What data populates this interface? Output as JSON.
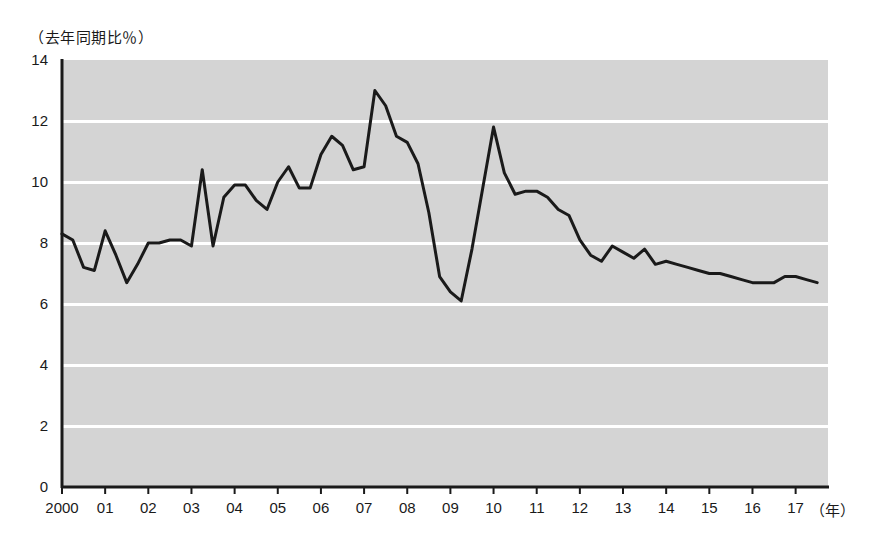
{
  "chart_data": {
    "type": "line",
    "title": "",
    "subtitle": "",
    "ylabel": "（去年同期比％）",
    "xlabel": "（年）",
    "ylim": [
      0,
      14
    ],
    "yticks": [
      0,
      2,
      4,
      6,
      8,
      10,
      12,
      14
    ],
    "ytick_labels": [
      "0",
      "2",
      "4",
      "6",
      "8",
      "10",
      "12",
      "14"
    ],
    "xlim": [
      2000,
      2017.75
    ],
    "xticks": [
      2000,
      2001,
      2002,
      2003,
      2004,
      2005,
      2006,
      2007,
      2008,
      2009,
      2010,
      2011,
      2012,
      2013,
      2014,
      2015,
      2016,
      2017
    ],
    "xtick_labels": [
      "2000",
      "01",
      "02",
      "03",
      "04",
      "05",
      "06",
      "07",
      "08",
      "09",
      "10",
      "11",
      "12",
      "13",
      "14",
      "15",
      "16",
      "17"
    ],
    "grid": true,
    "grid_color": "#ffffff",
    "plot_background": "#d4d4d4",
    "line_color": "#1a1a1a",
    "line_width": 3,
    "legend": [],
    "annotations": [],
    "series": [
      {
        "name": "前年同期比",
        "x": [
          2000.0,
          2000.25,
          2000.5,
          2000.75,
          2001.0,
          2001.25,
          2001.5,
          2001.75,
          2002.0,
          2002.25,
          2002.5,
          2002.75,
          2003.0,
          2003.25,
          2003.5,
          2003.75,
          2004.0,
          2004.25,
          2004.5,
          2004.75,
          2005.0,
          2005.25,
          2005.5,
          2005.75,
          2006.0,
          2006.25,
          2006.5,
          2006.75,
          2007.0,
          2007.25,
          2007.5,
          2007.75,
          2008.0,
          2008.25,
          2008.5,
          2008.75,
          2009.0,
          2009.25,
          2009.5,
          2009.75,
          2010.0,
          2010.25,
          2010.5,
          2010.75,
          2011.0,
          2011.25,
          2011.5,
          2011.75,
          2012.0,
          2012.25,
          2012.5,
          2012.75,
          2013.0,
          2013.25,
          2013.5,
          2013.75,
          2014.0,
          2014.25,
          2014.5,
          2014.75,
          2015.0,
          2015.25,
          2015.5,
          2015.75,
          2016.0,
          2016.25,
          2016.5,
          2016.75,
          2017.0,
          2017.25,
          2017.5
        ],
        "values": [
          8.3,
          8.1,
          7.2,
          7.1,
          8.4,
          7.6,
          6.7,
          7.3,
          8.0,
          8.0,
          8.1,
          8.1,
          7.9,
          10.4,
          7.9,
          9.5,
          9.9,
          9.9,
          9.4,
          9.1,
          10.0,
          10.5,
          9.8,
          9.8,
          10.9,
          11.5,
          11.2,
          10.4,
          10.5,
          13.0,
          12.5,
          11.5,
          11.3,
          10.6,
          9.0,
          6.9,
          6.4,
          6.1,
          7.8,
          9.8,
          11.8,
          10.3,
          9.6,
          9.7,
          9.7,
          9.5,
          9.1,
          8.9,
          8.1,
          7.6,
          7.4,
          7.9,
          7.7,
          7.5,
          7.8,
          7.3,
          7.4,
          7.3,
          7.2,
          7.1,
          7.0,
          7.0,
          6.9,
          6.8,
          6.7,
          6.7,
          6.7,
          6.9,
          6.9,
          6.8,
          6.7
        ]
      }
    ]
  }
}
